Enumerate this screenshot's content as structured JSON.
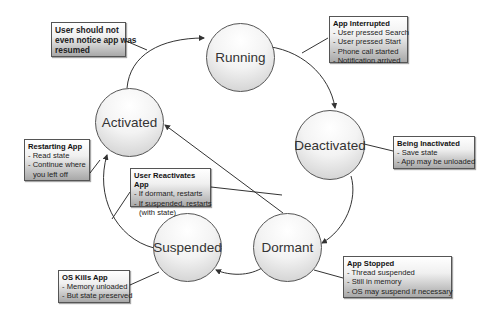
{
  "diagram": {
    "states": [
      {
        "id": "running",
        "label": "Running"
      },
      {
        "id": "deactivated",
        "label": "Deactivated"
      },
      {
        "id": "dormant",
        "label": "Dormant"
      },
      {
        "id": "suspended",
        "label": "Suspended"
      },
      {
        "id": "activated",
        "label": "Activated"
      }
    ],
    "transitions": [
      {
        "from": "activated",
        "to": "running"
      },
      {
        "from": "running",
        "to": "deactivated"
      },
      {
        "from": "deactivated",
        "to": "dormant"
      },
      {
        "from": "dormant",
        "to": "suspended"
      },
      {
        "from": "dormant",
        "to": "activated"
      },
      {
        "from": "suspended",
        "to": "activated"
      }
    ],
    "notes": {
      "resumed": {
        "text": "User should not even notice app was resumed",
        "lines": [
          "User should not",
          "even notice app was",
          "resumed"
        ]
      },
      "interrupted": {
        "title": "App Interrupted",
        "lines": [
          "- User pressed Search",
          "- User pressed Start",
          "- Phone call started",
          "- Notification arrived"
        ]
      },
      "inactivated": {
        "title": "Being Inactivated",
        "lines": [
          "- Save state",
          "- App may be unloaded"
        ]
      },
      "restarting": {
        "title": "Restarting App",
        "lines": [
          "- Read state",
          "- Continue where",
          "  you left off"
        ]
      },
      "reactivates": {
        "title": "User Reactivates App",
        "lines": [
          "- If dormant, restarts",
          "- If suspended, restarts",
          "  (with state)"
        ]
      },
      "stopped": {
        "title": "App Stopped",
        "lines": [
          "- Thread suspended",
          "- Still in memory",
          "- OS may suspend if necessary"
        ]
      },
      "kills": {
        "title": "OS Kills App",
        "lines": [
          "- Memory unloaded",
          "- But state preserved"
        ]
      }
    }
  }
}
